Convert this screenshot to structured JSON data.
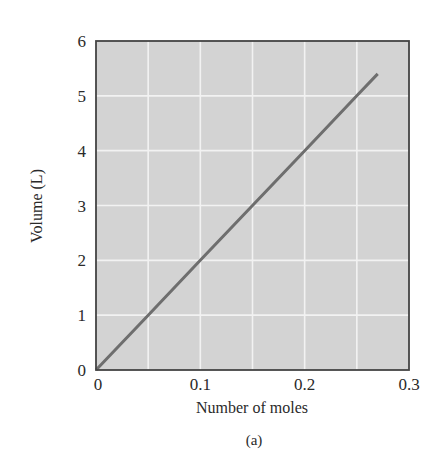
{
  "chart_data": {
    "type": "line",
    "title": "",
    "caption": "(a)",
    "xlabel": "Number of moles",
    "ylabel": "Volume (L)",
    "xlim": [
      0,
      0.3
    ],
    "ylim": [
      0,
      6
    ],
    "x_ticks": [
      "0",
      "0.1",
      "0.2",
      "0.3"
    ],
    "y_ticks": [
      "0",
      "1",
      "2",
      "3",
      "4",
      "5",
      "6"
    ],
    "x_gridlines": [
      0.05,
      0.1,
      0.15,
      0.2,
      0.25
    ],
    "y_gridlines": [
      1,
      2,
      3,
      4,
      5
    ],
    "grid": true,
    "legend": null,
    "series": [
      {
        "name": "Volume vs moles",
        "x": [
          0,
          0.05,
          0.1,
          0.15,
          0.2,
          0.25,
          0.27
        ],
        "y": [
          0,
          1.0,
          2.0,
          3.0,
          4.0,
          5.0,
          5.4
        ],
        "color": "#6e6e6e"
      }
    ],
    "colors": {
      "plot_background": "#d3d3d3",
      "gridline": "#f2f2f2",
      "frame": "#444444",
      "line": "#6e6e6e"
    }
  }
}
